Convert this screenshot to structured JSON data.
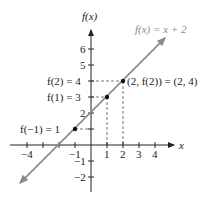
{
  "figure": {
    "function_label": "f(x) = x + 2",
    "y_axis_label": "f(x)",
    "x_axis_label": "x",
    "x_ticks": [
      {
        "value": -4,
        "label": "−4"
      },
      {
        "value": -3,
        "label": ""
      },
      {
        "value": -2,
        "label": ""
      },
      {
        "value": -1,
        "label": "−1"
      },
      {
        "value": 1,
        "label": "1"
      },
      {
        "value": 2,
        "label": "2"
      },
      {
        "value": 3,
        "label": "3"
      },
      {
        "value": 4,
        "label": "4"
      }
    ],
    "y_ticks": [
      {
        "value": 6,
        "label": "6"
      },
      {
        "value": 5,
        "label": "5"
      },
      {
        "value": 4,
        "label": ""
      },
      {
        "value": 3,
        "label": ""
      },
      {
        "value": 2,
        "label": "2"
      },
      {
        "value": 1,
        "label": ""
      },
      {
        "value": -1,
        "label": "−1"
      },
      {
        "value": -2,
        "label": "−2"
      }
    ],
    "points": [
      {
        "x": -1,
        "y": 1,
        "label": "f(−1) = 1"
      },
      {
        "x": 1,
        "y": 3,
        "label": "f(1) = 3"
      },
      {
        "x": 2,
        "y": 4,
        "label": "f(2) = 4"
      }
    ],
    "point_annotation": "(2, f(2)) = (2, 4)",
    "colors": {
      "axis": "#222222",
      "line": "#8a8a8a",
      "point": "#111111",
      "dashed": "#555555"
    }
  }
}
